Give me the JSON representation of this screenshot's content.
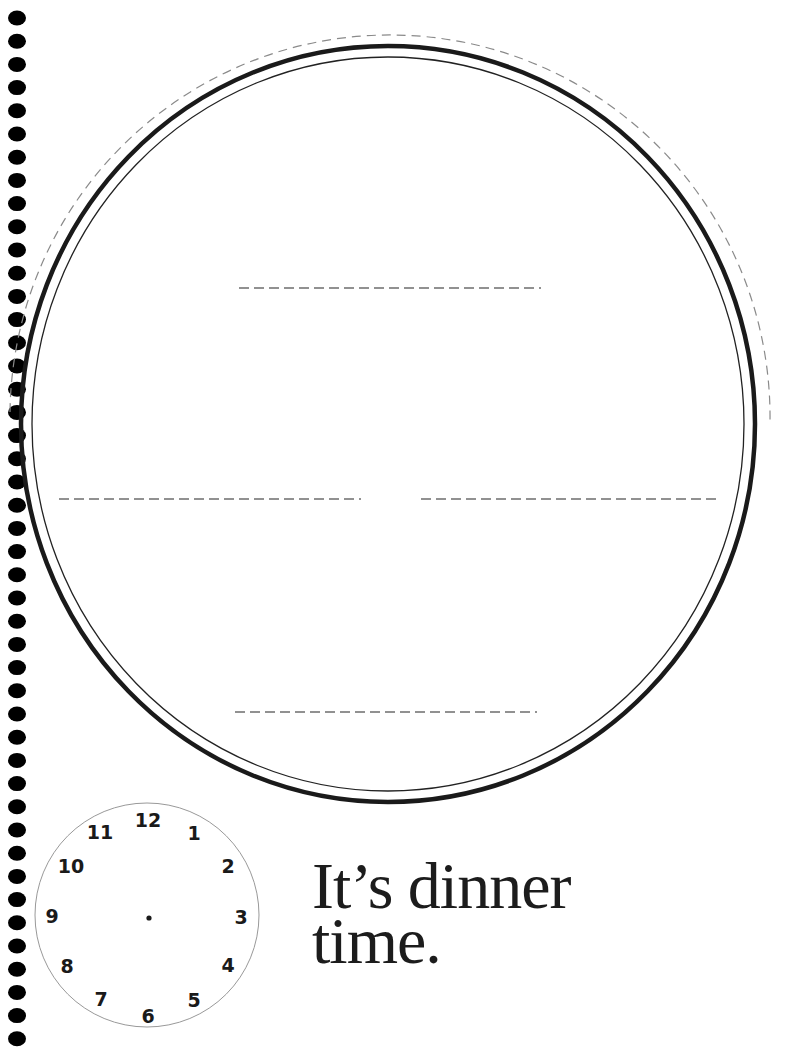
{
  "page": {
    "kind": "printable activity page",
    "background": "#ffffff"
  },
  "binding": {
    "hole_count": 45,
    "hole_color": "#000000",
    "first_hole_y": 18,
    "hole_spacing": 23.2
  },
  "plate": {
    "description": "large plate outline with drawing area",
    "outer_ring_color": "#1a1a1a",
    "inner_ring_color": "#222222",
    "cut_line_color": "#888888",
    "write_lines": [
      {
        "name": "top-line",
        "x1": 239,
        "x2": 541,
        "y": 288
      },
      {
        "name": "left-line",
        "x1": 59,
        "x2": 361,
        "y": 499
      },
      {
        "name": "right-line",
        "x1": 421,
        "x2": 720,
        "y": 499
      },
      {
        "name": "bottom-line",
        "x1": 235,
        "x2": 537,
        "y": 712
      }
    ]
  },
  "clock": {
    "numbers": [
      "12",
      "1",
      "2",
      "3",
      "4",
      "5",
      "6",
      "7",
      "8",
      "9",
      "10",
      "11"
    ],
    "outline_color": "#999999"
  },
  "title": {
    "line1": "It’s dinner",
    "line2": "time."
  }
}
